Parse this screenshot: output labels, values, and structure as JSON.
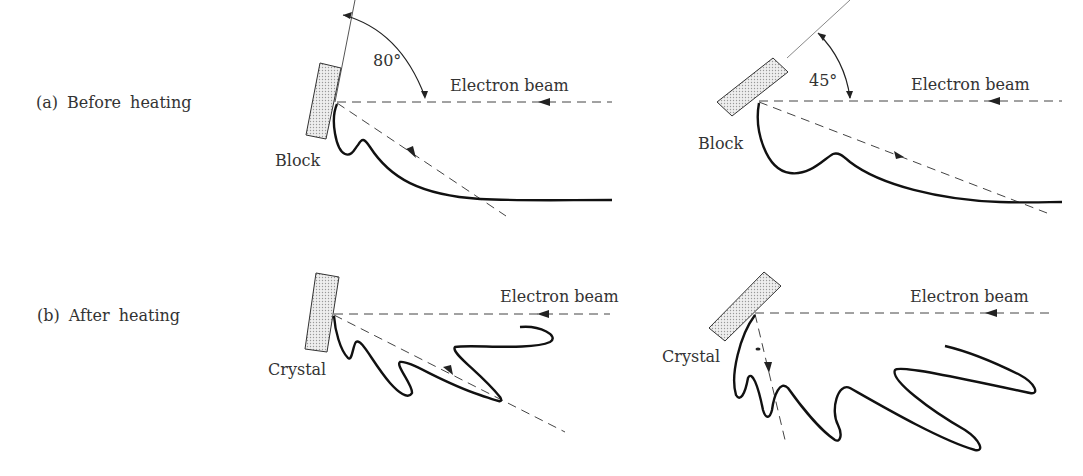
{
  "figure": {
    "rows": [
      {
        "label": "(a)  Before  heating",
        "panels": [
          {
            "object_label": "Block",
            "beam_label": "Electron beam",
            "angle_label": "80°",
            "tilt_deg": 80
          },
          {
            "object_label": "Block",
            "beam_label": "Electron beam",
            "angle_label": "45°",
            "tilt_deg": 45
          }
        ]
      },
      {
        "label": "(b)  After  heating",
        "panels": [
          {
            "object_label": "Crystal",
            "beam_label": "Electron beam"
          },
          {
            "object_label": "Crystal",
            "beam_label": "Electron beam"
          }
        ]
      }
    ],
    "colors": {
      "line": "#222222",
      "dashed": "#444444",
      "sample_fill": "#d8d8d8",
      "text": "#333333"
    }
  }
}
